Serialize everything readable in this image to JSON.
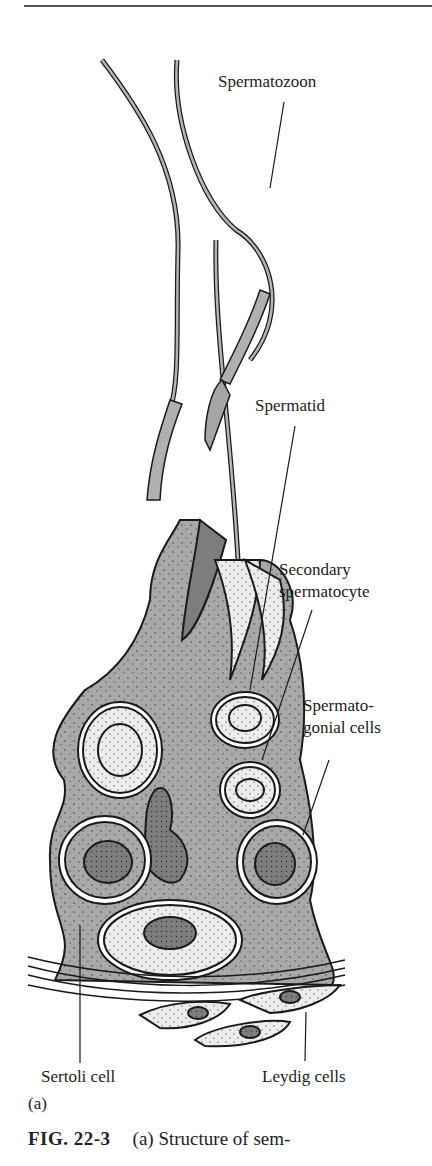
{
  "figure": {
    "labels": {
      "spermatozoon": "Spermatozoon",
      "spermatid": "Spermatid",
      "secondary_spermatocyte_line1": "Secondary",
      "secondary_spermatocyte_line2": "spermatocyte",
      "spermatogonial_line1": "Spermato-",
      "spermatogonial_line2": "gonial cells",
      "sertoli_cell": "Sertoli cell",
      "leydig_cells": "Leydig cells",
      "panel": "(a)"
    },
    "colors": {
      "sertoli_fill": "#a8a8a8",
      "cell_light_fill": "#ececec",
      "nucleus_dark_fill": "#7d7d7d",
      "outline": "#1a1a1a"
    }
  },
  "caption": {
    "fig_number": "FIG. 22-3",
    "text": "(a) Structure of sem-"
  }
}
